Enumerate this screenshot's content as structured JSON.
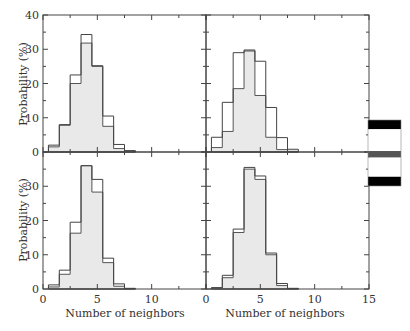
{
  "chart_data": {
    "type": "bar",
    "subtype": "step-histogram-2x2-panels",
    "xlabel": "Number of neighbors",
    "ylabel": "Probability (%)",
    "xlim": [
      0,
      15
    ],
    "ylim": [
      0,
      40
    ],
    "x_ticks": [
      0,
      5,
      10,
      15
    ],
    "y_ticks": [
      0,
      10,
      20,
      30,
      40
    ],
    "bins": [
      1,
      2,
      3,
      4,
      5,
      6,
      7,
      8
    ],
    "panels": [
      {
        "position": "top-left",
        "series": [
          {
            "name": "outline",
            "values": [
              2.0,
              8.0,
              22.5,
              34.3,
              25.2,
              10.5,
              2.2,
              0.4
            ]
          },
          {
            "name": "filled",
            "values": [
              1.5,
              7.8,
              20.0,
              31.8,
              25.0,
              7.5,
              1.0,
              0.3
            ]
          }
        ]
      },
      {
        "position": "top-right",
        "series": [
          {
            "name": "outline",
            "values": [
              4.3,
              14.5,
              29.0,
              29.5,
              26.5,
              13.0,
              4.2,
              0.8
            ]
          },
          {
            "name": "filled",
            "values": [
              1.3,
              6.0,
              18.5,
              29.8,
              16.5,
              4.3,
              0.7,
              0.2
            ]
          }
        ]
      },
      {
        "position": "bottom-left",
        "series": [
          {
            "name": "outline",
            "values": [
              1.2,
              5.5,
              19.5,
              36.0,
              32.0,
              9.0,
              1.5,
              0.2
            ]
          },
          {
            "name": "filled",
            "values": [
              0.6,
              4.3,
              16.3,
              36.0,
              28.3,
              7.7,
              0.8,
              0.1
            ]
          }
        ]
      },
      {
        "position": "bottom-right",
        "series": [
          {
            "name": "outline",
            "values": [
              0.4,
              4.0,
              17.5,
              35.5,
              33.0,
              10.5,
              1.6,
              0.2
            ]
          },
          {
            "name": "filled",
            "values": [
              0.3,
              3.3,
              16.5,
              35.0,
              32.0,
              10.0,
              1.0,
              0.1
            ]
          }
        ]
      }
    ],
    "legend_bar": {
      "position": "right",
      "segments": [
        {
          "color": "#000000",
          "fraction": 0.14
        },
        {
          "color": "#ffffff",
          "fraction": 0.33
        },
        {
          "color": "#555555",
          "fraction": 0.1
        },
        {
          "color": "#ffffff",
          "fraction": 0.29
        },
        {
          "color": "#000000",
          "fraction": 0.14
        }
      ]
    },
    "colors": {
      "fill": "#e9e9e9",
      "filled_edge": "#555555",
      "outline_edge": "#444444",
      "frame": "#444444"
    },
    "grid": false,
    "legend": "none"
  },
  "labels": {
    "ylabel": "Probability (%)",
    "xlabel": "Number of neighbors",
    "ytick": [
      "0",
      "10",
      "20",
      "30",
      "40"
    ],
    "xtick": [
      "0",
      "5",
      "10",
      "15"
    ]
  }
}
